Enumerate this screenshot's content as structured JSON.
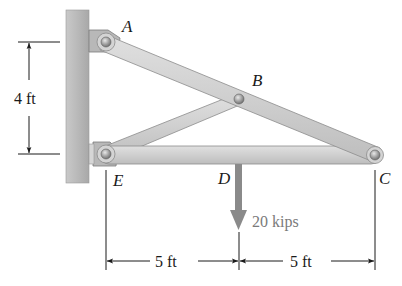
{
  "figure": {
    "points": {
      "A": "A",
      "B": "B",
      "C": "C",
      "D": "D",
      "E": "E"
    },
    "load": {
      "label": "20 kips",
      "value": 20,
      "unit": "kips",
      "color": "#8a8a8a"
    },
    "dimensions": {
      "vertical_AE": "4 ft",
      "horizontal_ED": "5 ft",
      "horizontal_DC": "5 ft"
    },
    "colors": {
      "member_fill": "#cfcfcf",
      "member_edge": "#8c8c8c",
      "wall": "#bdbdbd",
      "pin": "#9a9a9a"
    }
  }
}
